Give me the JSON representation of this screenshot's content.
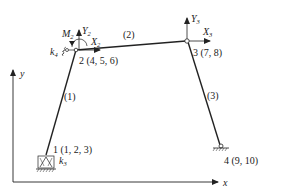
{
  "diagram": {
    "type": "plane-frame-structural-model",
    "axes": {
      "x_label": "x",
      "y_label": "y"
    },
    "nodes": [
      {
        "id": "1",
        "label": "1 (1, 2, 3)",
        "dofs": [
          1,
          2,
          3
        ],
        "support": "spring-supported pinned",
        "spring_label": "k",
        "spring_sub": "3"
      },
      {
        "id": "2",
        "label": "2 (4, 5, 6)",
        "dofs": [
          4,
          5,
          6
        ],
        "force_x": "X",
        "force_x_sub": "2",
        "force_y": "Y",
        "force_y_sub": "2",
        "moment": "M",
        "moment_sub": "2",
        "spring_label": "k",
        "spring_sub": "4"
      },
      {
        "id": "3",
        "label": "3 (7, 8)",
        "dofs": [
          7,
          8
        ],
        "hinge": true,
        "force_x": "X",
        "force_x_sub": "3",
        "force_y": "Y",
        "force_y_sub": "3"
      },
      {
        "id": "4",
        "label": "4 (9, 10)",
        "dofs": [
          9,
          10
        ],
        "support": "pinned"
      }
    ],
    "elements": [
      {
        "label": "(1)",
        "from": "1",
        "to": "2"
      },
      {
        "label": "(2)",
        "from": "2",
        "to": "3"
      },
      {
        "label": "(3)",
        "from": "3",
        "to": "4"
      }
    ],
    "colors": {
      "line": "#222222",
      "background": "#ffffff"
    }
  }
}
